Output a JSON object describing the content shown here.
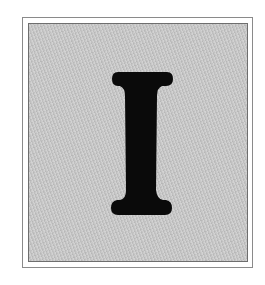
{
  "illustration": {
    "letter": "I",
    "colors": {
      "background": "#ffffff",
      "panel": "#c9c9c9",
      "letter": "#0a0a0a",
      "frame_border": "#8a8a8a"
    }
  }
}
